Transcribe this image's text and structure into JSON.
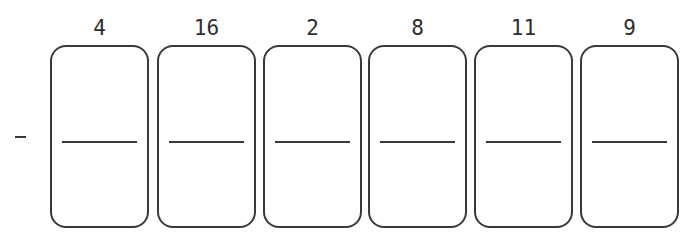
{
  "operator": "-",
  "cards": [
    {
      "label": "4"
    },
    {
      "label": "16"
    },
    {
      "label": "2"
    },
    {
      "label": "8"
    },
    {
      "label": "11"
    },
    {
      "label": "9"
    }
  ]
}
